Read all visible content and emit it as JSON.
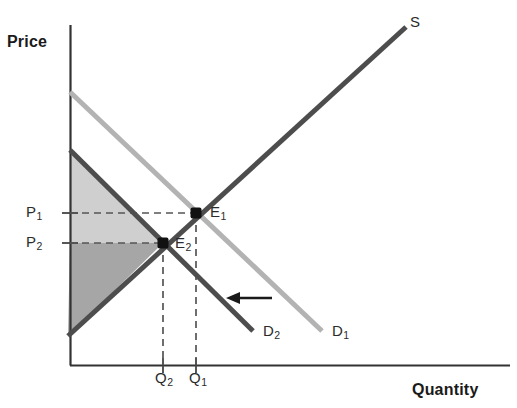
{
  "figure": {
    "width": 517,
    "height": 408,
    "background": "#ffffff"
  },
  "axes": {
    "y_title": "Price",
    "x_title": "Quantity",
    "color": "#333333",
    "origin": {
      "x": 70,
      "y": 365
    },
    "y_top": 25,
    "x_right": 510
  },
  "labels": {
    "supply": "S",
    "demand_1": "D",
    "demand_1_sub": "1",
    "demand_2": "D",
    "demand_2_sub": "2",
    "equilibrium_1": "E",
    "equilibrium_1_sub": "1",
    "equilibrium_2": "E",
    "equilibrium_2_sub": "2",
    "price_1": "P",
    "price_1_sub": "1",
    "price_2": "P",
    "price_2_sub": "2",
    "quantity_1": "Q",
    "quantity_1_sub": "1",
    "quantity_2": "Q",
    "quantity_2_sub": "2"
  },
  "colors": {
    "supply_curve": "#4d4d4d",
    "demand_1_curve": "#b3b3b3",
    "demand_2_curve": "#4d4d4d",
    "shade_light": "#cfcfcf",
    "shade_dark": "#a6a6a6",
    "guide_line": "#555555",
    "point_fill": "#111111",
    "arrow": "#1a1a1a",
    "text": "#1a1a1a"
  },
  "chart_data": {
    "type": "line",
    "title": "",
    "subtitle": "",
    "xlabel": "Quantity",
    "ylabel": "Price",
    "xlim": [
      70,
      510
    ],
    "ylim": [
      365,
      25
    ],
    "grid": false,
    "legend": "inline-curve-labels",
    "axis_ticks_labeled": false,
    "series": [
      {
        "name": "S",
        "role": "supply",
        "color": "#4d4d4d",
        "width": 5,
        "points": [
          [
            68,
            336
          ],
          [
            406,
            27
          ]
        ]
      },
      {
        "name": "D1",
        "role": "original-demand",
        "color": "#b3b3b3",
        "width": 5,
        "points": [
          [
            70,
            92
          ],
          [
            322,
            331
          ]
        ]
      },
      {
        "name": "D2",
        "role": "shifted-demand",
        "color": "#4d4d4d",
        "width": 5,
        "points": [
          [
            70,
            150
          ],
          [
            253,
            331
          ]
        ]
      }
    ],
    "points": [
      {
        "name": "E1",
        "label": "E₁",
        "x": 196,
        "y": 213,
        "marker": "square",
        "size": 11,
        "color": "#111111"
      },
      {
        "name": "E2",
        "label": "E₂",
        "x": 163,
        "y": 243,
        "marker": "square",
        "size": 11,
        "color": "#111111"
      }
    ],
    "guides": [
      {
        "name": "P1-guide",
        "from": [
          70,
          213
        ],
        "to": [
          196,
          213
        ],
        "style": "dashed"
      },
      {
        "name": "P2-guide",
        "from": [
          70,
          243
        ],
        "to": [
          163,
          243
        ],
        "style": "dashed"
      },
      {
        "name": "Q1-guide",
        "from": [
          196,
          213
        ],
        "to": [
          196,
          365
        ],
        "style": "dashed"
      },
      {
        "name": "Q2-guide",
        "from": [
          163,
          243
        ],
        "to": [
          163,
          365
        ],
        "style": "dashed"
      }
    ],
    "ticks": [
      {
        "name": "P1-tick",
        "axis": "y",
        "value": 213
      },
      {
        "name": "P2-tick",
        "axis": "y",
        "value": 243
      },
      {
        "name": "Q1-tick",
        "axis": "x",
        "value": 196
      },
      {
        "name": "Q2-tick",
        "axis": "x",
        "value": 163
      }
    ],
    "shaded_regions": [
      {
        "name": "consumer-surplus",
        "fill": "#cfcfcf",
        "vertices": [
          [
            70,
            150
          ],
          [
            163,
            243
          ],
          [
            70,
            243
          ]
        ]
      },
      {
        "name": "producer-surplus",
        "fill": "#a6a6a6",
        "vertices": [
          [
            70,
            243
          ],
          [
            163,
            243
          ],
          [
            68,
            336
          ]
        ]
      }
    ],
    "annotations": [
      {
        "name": "demand-shift-arrow",
        "type": "arrow",
        "direction": "left",
        "from": [
          272,
          298
        ],
        "to": [
          228,
          298
        ],
        "color": "#1a1a1a"
      }
    ]
  }
}
